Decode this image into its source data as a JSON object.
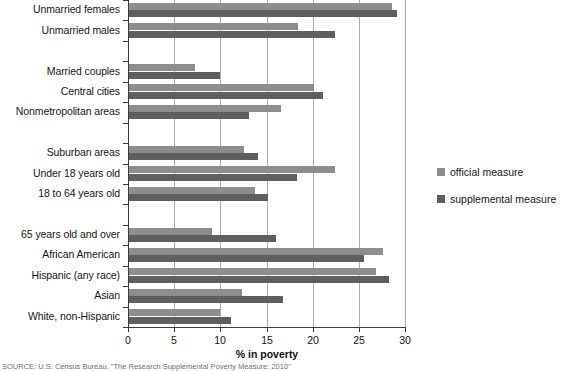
{
  "chart_data": {
    "type": "bar",
    "orientation": "horizontal",
    "title": "",
    "xlabel": "% in poverty",
    "ylabel": "",
    "xlim": [
      0,
      30
    ],
    "xticks": [
      0,
      5,
      10,
      15,
      20,
      25,
      30
    ],
    "grid": "vertical",
    "legend_position": "right",
    "categories": [
      "Unmarried females",
      "Unmarried males",
      "Married couples",
      "Central cities",
      "Nonmetropolitan areas",
      "Suburban areas",
      "Under 18 years old",
      "18 to 64 years old",
      "65 years old and over",
      "African American",
      "Hispanic (any race)",
      "Asian",
      "White, non-Hispanic"
    ],
    "series": [
      {
        "name": "official measure",
        "color": "#8d8d8d",
        "values": [
          28.5,
          18.3,
          7.2,
          20.0,
          16.5,
          12.5,
          22.3,
          13.7,
          9.0,
          27.5,
          26.7,
          12.2,
          9.9
        ]
      },
      {
        "name": "supplemental measure",
        "color": "#5f5f5f",
        "values": [
          29.0,
          22.3,
          9.9,
          21.0,
          13.0,
          14.0,
          18.2,
          15.0,
          15.9,
          25.4,
          28.2,
          16.7,
          11.0
        ]
      }
    ],
    "group_breaks_after": [
      2,
      5,
      8
    ]
  },
  "legend": {
    "items": [
      {
        "label": "official measure",
        "color": "#8d8d8d"
      },
      {
        "label": "supplemental measure",
        "color": "#5f5f5f"
      }
    ]
  },
  "axis": {
    "x_title": "% in poverty",
    "tick_labels": [
      "0",
      "5",
      "10",
      "15",
      "20",
      "25",
      "30"
    ]
  },
  "source_note": "SOURCE: U.S. Census Bureau, \"The Research Supplemental Poverty Measure: 2010\""
}
